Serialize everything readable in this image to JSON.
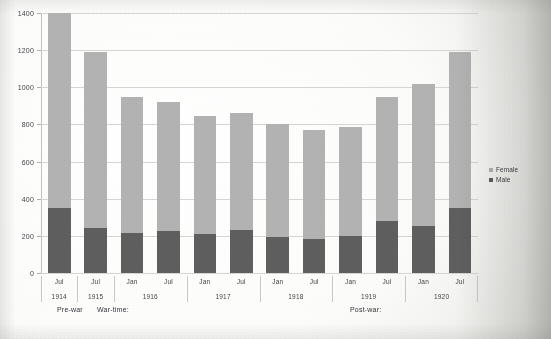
{
  "chart_data": {
    "type": "bar",
    "subtype": "stacked-vertical",
    "title": "",
    "xlabel": "",
    "ylabel": "",
    "ylim": [
      0,
      1400
    ],
    "ytick_step": 200,
    "yticks": [
      0,
      200,
      400,
      600,
      800,
      1000,
      1200,
      1400
    ],
    "ytick_labels": [
      "0",
      "200",
      "400",
      "600",
      "800",
      "1000",
      "1200",
      "1400"
    ],
    "grid": true,
    "legend_position": "right",
    "categories": [
      "Jul 1914",
      "Jul 1915",
      "Jan 1916",
      "Jul 1916",
      "Jan 1917",
      "Jul 1917",
      "Jan 1918",
      "Jul 1918",
      "Jan 1919",
      "Jul 1919",
      "Jan 1920",
      "Jul 1920"
    ],
    "months": [
      "Jul",
      "Jul",
      "Jan",
      "Jul",
      "Jan",
      "Jul",
      "Jan",
      "Jul",
      "Jan",
      "Jul",
      "Jan",
      "Jul"
    ],
    "series": [
      {
        "name": "Male",
        "color": "#5e5e5e",
        "values": [
          360,
          245,
          215,
          225,
          210,
          230,
          195,
          185,
          200,
          280,
          255,
          350
        ]
      },
      {
        "name": "Female",
        "color": "#b2b2b2",
        "values": [
          1085,
          945,
          735,
          695,
          635,
          630,
          605,
          585,
          585,
          670,
          765,
          840
        ]
      }
    ],
    "totals": [
      1445,
      1190,
      950,
      920,
      845,
      860,
      800,
      770,
      785,
      950,
      1020,
      1190
    ],
    "year_groups": [
      {
        "year": "1914",
        "span": 1
      },
      {
        "year": "1915",
        "span": 1
      },
      {
        "year": "1916",
        "span": 2
      },
      {
        "year": "1917",
        "span": 2
      },
      {
        "year": "1918",
        "span": 2
      },
      {
        "year": "1919",
        "span": 2
      },
      {
        "year": "1920",
        "span": 2
      }
    ],
    "annotations": [
      {
        "text": "Pre-war",
        "x_px": 57,
        "y_px": 306
      },
      {
        "text": "War-time:",
        "x_px": 97,
        "y_px": 306
      },
      {
        "text": "Post-war:",
        "x_px": 350,
        "y_px": 306
      }
    ],
    "legend": [
      {
        "label": "Female",
        "color": "#b2b2b2"
      },
      {
        "label": "Male",
        "color": "#5e5e5e"
      }
    ]
  }
}
